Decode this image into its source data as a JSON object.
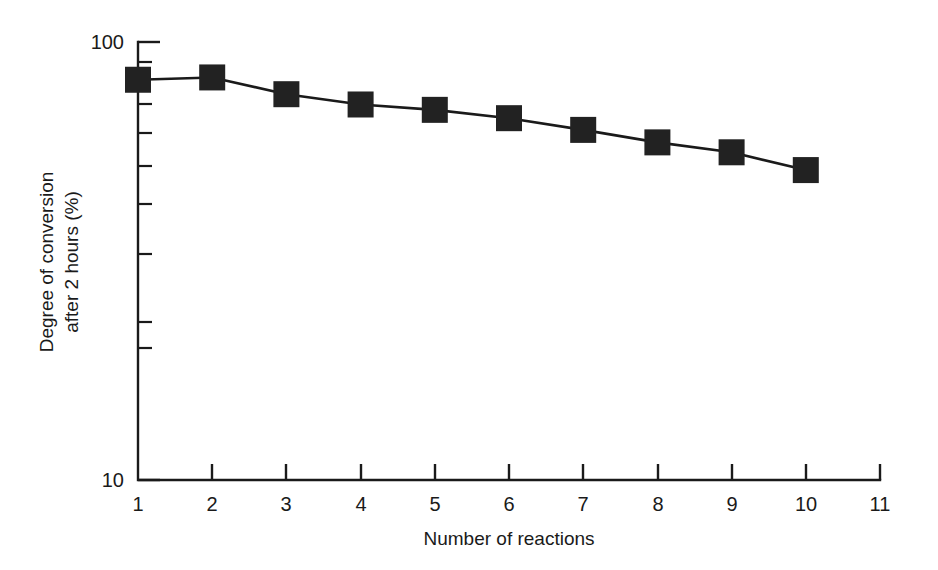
{
  "chart_data": {
    "type": "line",
    "title": "",
    "subtitle": "",
    "xlabel": "Number of reactions",
    "ylabel": "Degree of conversion after 2 hours (%)",
    "ylabel_lines": [
      "Degree of conversion",
      "after 2 hours (%)"
    ],
    "yscale": "log",
    "xscale": "linear",
    "xlim": [
      1,
      11
    ],
    "ylim": [
      10,
      100
    ],
    "grid": false,
    "legend": null,
    "x_tick_labels": [
      "1",
      "2",
      "3",
      "4",
      "5",
      "6",
      "7",
      "8",
      "9",
      "10",
      "11"
    ],
    "x_ticks": [
      1,
      2,
      3,
      4,
      5,
      6,
      7,
      8,
      9,
      10,
      11
    ],
    "y_tick_labels": [
      "100",
      "10"
    ],
    "y_ticks": [
      100,
      10
    ],
    "y_minor_ticks": [
      90,
      80,
      70,
      60,
      50,
      40,
      30,
      20
    ],
    "marker": "filled-square",
    "marker_color": "#222222",
    "line_color": "#1a1a1a",
    "x": [
      1,
      2,
      3,
      4,
      5,
      6,
      7,
      8,
      9,
      10
    ],
    "values": [
      82,
      83,
      76,
      72,
      70,
      67,
      63,
      59,
      56,
      51
    ],
    "series": [
      {
        "name": "Degree of conversion after 2 hours",
        "x": [
          1,
          2,
          3,
          4,
          5,
          6,
          7,
          8,
          9,
          10
        ],
        "values": [
          82,
          83,
          76,
          72,
          70,
          67,
          63,
          59,
          56,
          51
        ]
      }
    ],
    "annotations": []
  },
  "figure": {
    "background_color": "#ffffff",
    "axis_color": "#1a1a1a"
  }
}
